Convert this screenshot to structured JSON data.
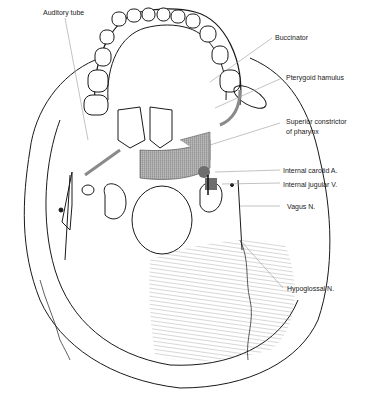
{
  "diagram": {
    "labels": {
      "auditory_tube": "Auditory tube",
      "buccinator": "Buccinator",
      "pterygoid_hamulus": "Pterygoid hamulus",
      "superior_constrictor_line1": "Superior constrictor",
      "superior_constrictor_line2": "of pharynx",
      "internal_carotid": "Internal carotid A.",
      "internal_jugular": "Internal jugular V.",
      "vagus": "Vagus N.",
      "hypoglossal": "Hypoglossal N."
    },
    "colors": {
      "line": "#1a1a1a",
      "muscle_band": "#8a8a8a",
      "vessel": "#6e6e6e",
      "leader": "#9a9a9a",
      "hatch": "#777777"
    }
  }
}
